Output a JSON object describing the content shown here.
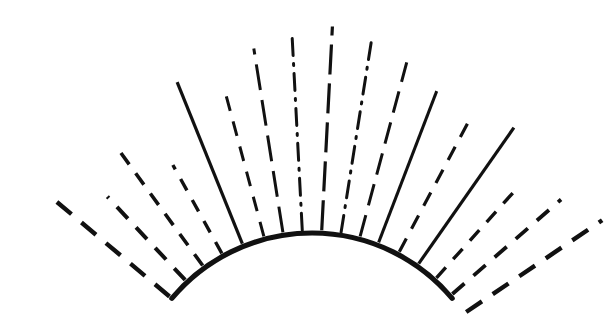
{
  "figure": {
    "background_color": "#ffffff",
    "stroke_color": "#111111",
    "canvas": {
      "width": 616,
      "height": 323
    }
  },
  "chart_data": {
    "type": "scatter",
    "subtitle": "",
    "xlabel": "",
    "ylabel": "",
    "grid": false,
    "legend": "none",
    "xlim": [
      0,
      616
    ],
    "ylim": [
      0,
      323
    ],
    "arc": {
      "name": "base-arc",
      "style": "solid",
      "stroke_width": 5.2,
      "center_x": 312,
      "center_y": 416,
      "radius": 183,
      "start_angle_deg": -140,
      "end_angle_deg": -40,
      "left_endpoint": [
        172,
        298
      ],
      "apex": [
        312,
        233
      ],
      "right_endpoint": [
        452,
        298
      ]
    },
    "rays": [
      {
        "name": "ray-1",
        "angle_deg": -140,
        "style": "dashed",
        "inner_radius": 186,
        "outer_radius": 345,
        "stroke_width": 4.4,
        "dash": "19 13"
      },
      {
        "name": "ray-2",
        "angle_deg": -133,
        "style": "dashed",
        "inner_radius": 186,
        "outer_radius": 300,
        "stroke_width": 4.0,
        "dash": "16 12"
      },
      {
        "name": "ray-3",
        "angle_deg": -126,
        "style": "dashed",
        "inner_radius": 186,
        "outer_radius": 330,
        "stroke_width": 3.6,
        "dash": "14 11"
      },
      {
        "name": "ray-4",
        "angle_deg": -119,
        "style": "dashed",
        "inner_radius": 186,
        "outer_radius": 287,
        "stroke_width": 3.4,
        "dash": "13 11"
      },
      {
        "name": "ray-5",
        "angle_deg": -112,
        "style": "solid",
        "inner_radius": 186,
        "outer_radius": 360,
        "stroke_width": 3.2,
        "dash": "none"
      },
      {
        "name": "ray-6",
        "angle_deg": -105,
        "style": "dashed",
        "inner_radius": 186,
        "outer_radius": 336,
        "stroke_width": 3.0,
        "dash": "15 11"
      },
      {
        "name": "ray-7",
        "angle_deg": -99,
        "style": "dashed",
        "inner_radius": 186,
        "outer_radius": 372,
        "stroke_width": 3.0,
        "dash": "26 10"
      },
      {
        "name": "ray-8",
        "angle_deg": -93,
        "style": "dash-dot",
        "inner_radius": 186,
        "outer_radius": 378,
        "stroke_width": 3.0,
        "dash": "17 8 2 8"
      },
      {
        "name": "ray-9",
        "angle_deg": -87,
        "style": "dashed",
        "inner_radius": 186,
        "outer_radius": 390,
        "stroke_width": 3.2,
        "dash": "30 9"
      },
      {
        "name": "ray-10",
        "angle_deg": -81,
        "style": "dash-dot",
        "inner_radius": 186,
        "outer_radius": 378,
        "stroke_width": 3.0,
        "dash": "17 8 2 8"
      },
      {
        "name": "ray-11",
        "angle_deg": -75,
        "style": "dashed",
        "inner_radius": 186,
        "outer_radius": 366,
        "stroke_width": 3.0,
        "dash": "22 10"
      },
      {
        "name": "ray-12",
        "angle_deg": -69,
        "style": "solid",
        "inner_radius": 186,
        "outer_radius": 348,
        "stroke_width": 3.0,
        "dash": "none"
      },
      {
        "name": "ray-13",
        "angle_deg": -62,
        "style": "dashed",
        "inner_radius": 186,
        "outer_radius": 336,
        "stroke_width": 3.2,
        "dash": "15 11"
      },
      {
        "name": "ray-14",
        "angle_deg": -55,
        "style": "solid",
        "inner_radius": 186,
        "outer_radius": 352,
        "stroke_width": 3.2,
        "dash": "none"
      },
      {
        "name": "ray-15",
        "angle_deg": -48,
        "style": "dashed",
        "inner_radius": 186,
        "outer_radius": 300,
        "stroke_width": 3.4,
        "dash": "14 11"
      },
      {
        "name": "ray-16",
        "angle_deg": -41,
        "style": "dashed",
        "inner_radius": 186,
        "outer_radius": 330,
        "stroke_width": 3.8,
        "dash": "16 12"
      },
      {
        "name": "ray-17",
        "angle_deg": -34,
        "style": "dashed",
        "inner_radius": 186,
        "outer_radius": 350,
        "stroke_width": 4.4,
        "dash": "19 13"
      }
    ]
  }
}
